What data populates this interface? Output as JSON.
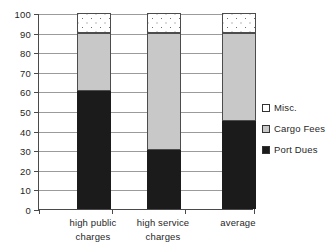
{
  "chart_data": {
    "type": "bar",
    "stacked": true,
    "title": "",
    "xlabel": "",
    "ylabel": "",
    "ylim": [
      0,
      100
    ],
    "ytick_step": 10,
    "yticks": [
      0,
      10,
      20,
      30,
      40,
      50,
      60,
      70,
      80,
      90,
      100
    ],
    "grid": true,
    "legend_position": "right",
    "categories": [
      "high public charges",
      "high service charges",
      "average"
    ],
    "category_lines": [
      [
        "high public",
        "charges"
      ],
      [
        "high service",
        "charges"
      ],
      [
        "average",
        ""
      ]
    ],
    "series": [
      {
        "name": "Port Dues",
        "color": "#1b1b1b",
        "values": [
          60,
          30,
          45
        ]
      },
      {
        "name": "Cargo Fees",
        "color": "#c8c8c8",
        "values": [
          30,
          60,
          45
        ]
      },
      {
        "name": "Misc.",
        "color": "#ffffff",
        "values": [
          10,
          10,
          10
        ]
      }
    ],
    "stack_order_bottom_to_top": [
      "Port Dues",
      "Cargo Fees",
      "Misc."
    ],
    "legend_entries": [
      "Misc.",
      "Cargo Fees",
      "Port Dues"
    ],
    "axis_color": "#4a4a4a",
    "grid_color": "#9b9b9b"
  }
}
